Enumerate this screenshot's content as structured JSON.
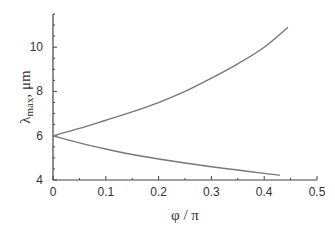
{
  "chart_data": {
    "type": "line",
    "title": "",
    "xlabel": "φ / π",
    "ylabel": "λ max , μm",
    "ylabel_main": "λ",
    "ylabel_sub": "max",
    "ylabel_unit": ", μm",
    "xlim": [
      0,
      0.5
    ],
    "ylim": [
      4,
      11.5
    ],
    "xticks": [
      "0",
      "0.1",
      "0.2",
      "0.3",
      "0.4",
      "0.5"
    ],
    "yticks": [
      "4",
      "6",
      "8",
      "10"
    ],
    "grid": false,
    "legend": null,
    "series": [
      {
        "name": "upper branch",
        "x": [
          0,
          0.05,
          0.1,
          0.15,
          0.2,
          0.25,
          0.3,
          0.35,
          0.4,
          0.445
        ],
        "y": [
          6.0,
          6.33,
          6.7,
          7.08,
          7.5,
          8.0,
          8.6,
          9.25,
          10.0,
          10.9
        ]
      },
      {
        "name": "lower branch",
        "x": [
          0,
          0.05,
          0.1,
          0.15,
          0.2,
          0.25,
          0.3,
          0.35,
          0.4,
          0.43
        ],
        "y": [
          6.0,
          5.68,
          5.4,
          5.15,
          4.95,
          4.77,
          4.6,
          4.45,
          4.3,
          4.22
        ]
      }
    ],
    "line_color": "#777777"
  }
}
